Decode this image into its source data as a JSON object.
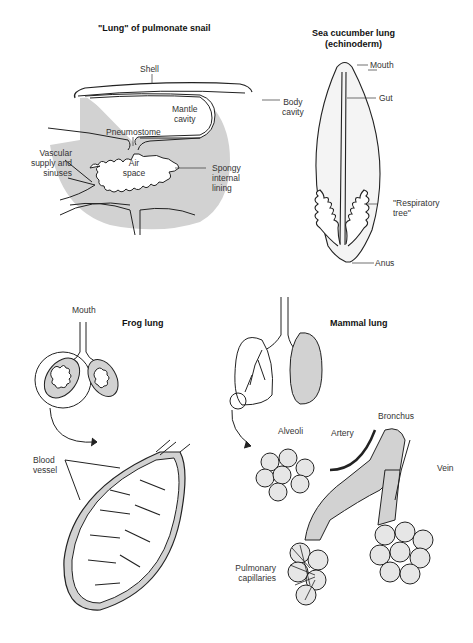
{
  "colors": {
    "shade": "#d2d2d2",
    "line": "#222222",
    "background": "#ffffff"
  },
  "panels": {
    "snail": {
      "title": "\"Lung\" of pulmonate snail",
      "labels": {
        "shell": "Shell",
        "mantle_1": "Mantle",
        "mantle_2": "cavity",
        "pneumostome": "Pneumostome",
        "vascular_1": "Vascular",
        "vascular_2": "supply and",
        "vascular_3": "sinuses",
        "air_1": "Air",
        "air_2": "space",
        "spongy_1": "Spongy",
        "spongy_2": "internal",
        "spongy_3": "lining"
      }
    },
    "sea_cucumber": {
      "title_1": "Sea cucumber lung",
      "title_2": "(echinoderm)",
      "labels": {
        "mouth": "Mouth",
        "gut": "Gut",
        "body_1": "Body",
        "body_2": "cavity",
        "resp_1": "\"Respiratory",
        "resp_2": "tree\"",
        "anus": "Anus"
      }
    },
    "frog": {
      "title": "Frog lung",
      "labels": {
        "mouth": "Mouth",
        "blood_1": "Blood",
        "blood_2": "vessel"
      }
    },
    "mammal": {
      "title": "Mammal lung",
      "labels": {
        "bronchus": "Bronchus",
        "artery": "Artery",
        "alveoli": "Alveoli",
        "vein": "Vein",
        "pulm_1": "Pulmonary",
        "pulm_2": "capillaries"
      }
    }
  }
}
